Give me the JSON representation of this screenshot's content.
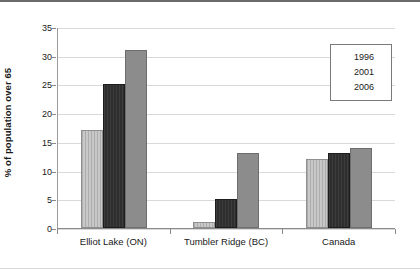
{
  "chart_data": {
    "type": "bar",
    "title": "",
    "subtitle": "",
    "xlabel": "",
    "ylabel": "% of population over 65",
    "categories": [
      "Elliot Lake (ON)",
      "Tumbler Ridge (BC)",
      "Canada"
    ],
    "series": [
      {
        "name": "1996",
        "color": "#c8c8c8",
        "values": [
          17,
          1,
          12
        ]
      },
      {
        "name": "2001",
        "color": "#2e2e2e",
        "values": [
          25,
          5,
          13
        ]
      },
      {
        "name": "2006",
        "color": "#8c8c8c",
        "values": [
          31,
          13,
          14
        ]
      }
    ],
    "ylim": [
      0,
      35
    ],
    "ytick_step": 5,
    "ytick_labels": [
      "0",
      "5",
      "10",
      "15",
      "20",
      "25",
      "30",
      "35"
    ],
    "grid": true,
    "grid_axis": "y",
    "legend_position": "top-right",
    "legend_entries": [
      "1996",
      "2001",
      "2006"
    ],
    "annotations": []
  },
  "figure": {
    "background_color": "#ffffff",
    "border_top_color": "#6b6b6b",
    "border_bottom_color": "#d8d8d8",
    "axis_color": "#8a8a8a",
    "gridline_color": "#d9d9d9",
    "text_color": "#1a1a1a"
  }
}
